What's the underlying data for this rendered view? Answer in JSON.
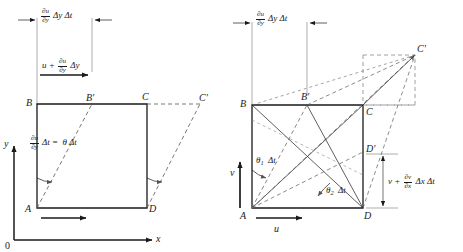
{
  "figure": {
    "background_color": "#ffffff",
    "line_color": "#1a1a1a",
    "dash_color": "#6b6b6b",
    "width": 463,
    "height": 252
  },
  "left_panel": {
    "name": "pure-shear-deformation-panel",
    "dimension_label": {
      "numerator": "∂u",
      "denominator": "∂y",
      "tail": "Δy Δt"
    },
    "velocity_label": {
      "lead": "u +",
      "numerator": "∂u",
      "denominator": "∂y",
      "tail": "Δy"
    },
    "angle_label": {
      "numerator": "∂u",
      "denominator": "∂y",
      "mid": "Δt =",
      "tail": "θ Δt"
    },
    "vertices": [
      {
        "name": "A",
        "label": "A"
      },
      {
        "name": "B",
        "label": "B"
      },
      {
        "name": "C",
        "label": "C"
      },
      {
        "name": "D",
        "label": "D"
      },
      {
        "name": "B-prime",
        "label": "B'"
      },
      {
        "name": "C-prime",
        "label": "C'"
      }
    ],
    "axes": {
      "x_label": "x",
      "y_label": "y",
      "origin_label": "0"
    }
  },
  "right_panel": {
    "name": "angular-deformation-rotation-panel",
    "dimension_label": {
      "numerator": "∂u",
      "denominator": "∂y",
      "tail": "Δy Δt"
    },
    "vertical_dimension_label": {
      "lead": "v +",
      "numerator": "∂v",
      "denominator": "∂x",
      "tail": "Δx Δt"
    },
    "angle_labels": [
      {
        "name": "theta-1",
        "symbol": "θ",
        "subscript": "1",
        "tail": "Δt"
      },
      {
        "name": "theta-2",
        "symbol": "θ",
        "subscript": "2",
        "tail": "Δt"
      }
    ],
    "velocity_labels": [
      {
        "name": "u-velocity",
        "label": "u"
      },
      {
        "name": "v-velocity",
        "label": "v"
      }
    ],
    "vertices": [
      {
        "name": "A",
        "label": "A"
      },
      {
        "name": "B",
        "label": "B"
      },
      {
        "name": "C",
        "label": "C"
      },
      {
        "name": "D",
        "label": "D"
      },
      {
        "name": "B-prime",
        "label": "B'"
      },
      {
        "name": "C-prime",
        "label": "C'"
      },
      {
        "name": "D-prime",
        "label": "D'"
      }
    ]
  }
}
